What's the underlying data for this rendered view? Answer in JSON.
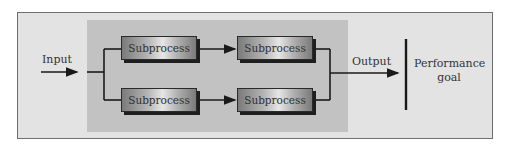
{
  "diagram": {
    "input_label": "Input",
    "output_label": "Output",
    "goal_label_line1": "Performance",
    "goal_label_line2": "goal",
    "subprocesses": [
      {
        "label": "Subprocess"
      },
      {
        "label": "Subprocess"
      },
      {
        "label": "Subprocess"
      },
      {
        "label": "Subprocess"
      }
    ]
  }
}
